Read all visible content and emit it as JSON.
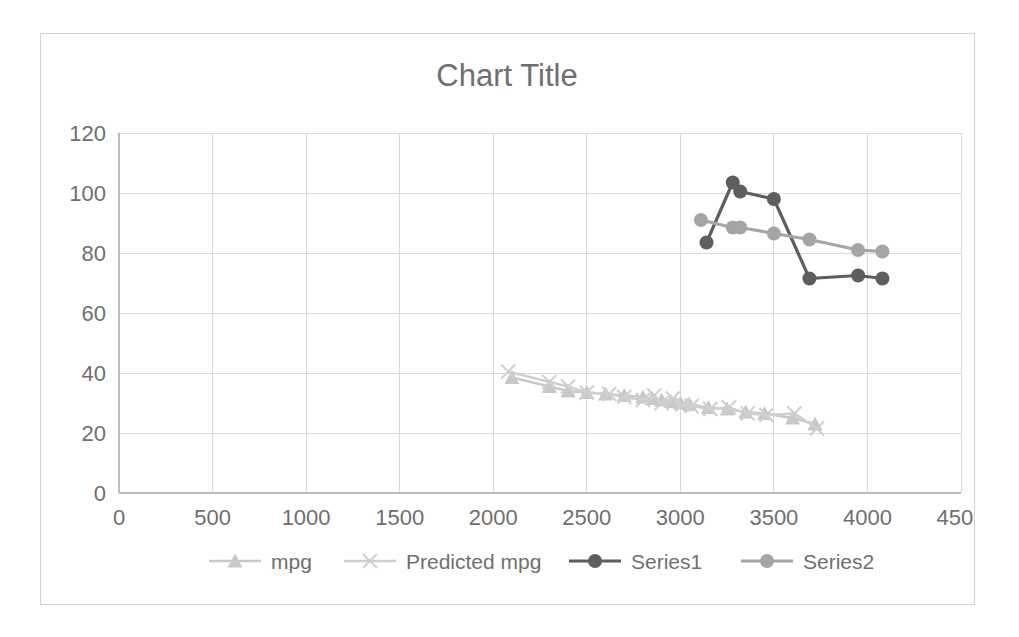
{
  "chart_data": {
    "type": "scatter",
    "title": "Chart Title",
    "xlabel": "",
    "ylabel": "",
    "xlim": [
      0,
      4500
    ],
    "ylim": [
      0,
      120
    ],
    "xticks": [
      0,
      500,
      1000,
      1500,
      2000,
      2500,
      3000,
      3500,
      4000,
      4500
    ],
    "yticks": [
      0,
      20,
      40,
      60,
      80,
      100,
      120
    ],
    "xtick_labels": [
      "0",
      "500",
      "1000",
      "1500",
      "2000",
      "2500",
      "3000",
      "3500",
      "4000",
      "4500"
    ],
    "ytick_labels": [
      "0",
      "20",
      "40",
      "60",
      "80",
      "100",
      "120"
    ],
    "grid": true,
    "legend_position": "bottom",
    "plot_bg": "#ffffff",
    "grid_color": "#d9d9d9",
    "series": [
      {
        "name": "mpg",
        "marker": "triangle",
        "color": "#c8c8c8",
        "line_color": "#c8c8c8",
        "x": [
          2100,
          2300,
          2400,
          2500,
          2600,
          2700,
          2800,
          2850,
          2900,
          2950,
          3000,
          3050,
          3150,
          3250,
          3350,
          3450,
          3600,
          3720
        ],
        "y": [
          38.5,
          35.5,
          34.0,
          33.5,
          33.0,
          32.5,
          32.0,
          31.5,
          31.0,
          30.5,
          30.0,
          29.5,
          28.5,
          28.0,
          27.0,
          26.5,
          25.0,
          23.0
        ]
      },
      {
        "name": "Predicted mpg",
        "marker": "x",
        "color": "#cfcfcf",
        "line_color": "#cfcfcf",
        "x": [
          2080,
          2300,
          2400,
          2500,
          2620,
          2700,
          2800,
          2860,
          2900,
          2960,
          3010,
          3060,
          3160,
          3260,
          3360,
          3460,
          3610,
          3730
        ],
        "y": [
          40.5,
          37.0,
          35.5,
          33.5,
          33.0,
          32.0,
          31.0,
          32.5,
          30.0,
          31.5,
          29.5,
          29.0,
          28.0,
          28.5,
          26.5,
          26.0,
          26.5,
          21.5
        ]
      },
      {
        "name": "Series1",
        "marker": "circle",
        "color": "#5e5e5e",
        "line_color": "#5e5e5e",
        "x": [
          3140,
          3280,
          3320,
          3500,
          3690,
          3950,
          4080
        ],
        "y": [
          83.5,
          103.5,
          100.5,
          98.0,
          71.5,
          72.5,
          71.5
        ]
      },
      {
        "name": "Series2",
        "marker": "circle",
        "color": "#a5a5a5",
        "line_color": "#a5a5a5",
        "x": [
          3110,
          3280,
          3320,
          3500,
          3690,
          3950,
          4080
        ],
        "y": [
          91.0,
          88.5,
          88.5,
          86.5,
          84.5,
          81.0,
          80.5
        ]
      }
    ]
  },
  "legend": {
    "items": [
      {
        "label": "mpg"
      },
      {
        "label": "Predicted mpg"
      },
      {
        "label": "Series1"
      },
      {
        "label": "Series2"
      }
    ]
  }
}
